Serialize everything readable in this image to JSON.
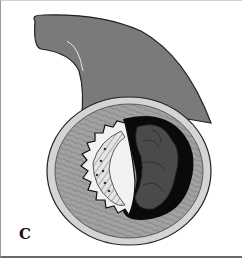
{
  "figure": {
    "panel_label": "C",
    "colors": {
      "adventitia": "#7a7a7a",
      "outer_ring": "#d4d4d4",
      "media": "#9c9c9c",
      "lumen_black": "#0a0a0a",
      "thrombus": "#4a4a4a",
      "stent_fill": "#f2f2f2",
      "plaque_hatch": "#cfcfcf",
      "background": "#ffffff"
    }
  }
}
